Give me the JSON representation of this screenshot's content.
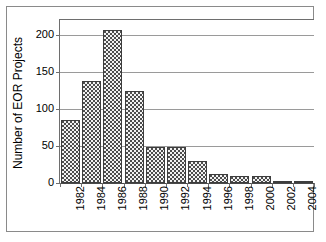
{
  "chart_data": {
    "type": "bar",
    "title": "",
    "subtitle": "",
    "xlabel": "",
    "ylabel": "Number of EOR Projects",
    "categories": [
      "1982",
      "1984",
      "1986",
      "1988",
      "1990",
      "1992",
      "1994",
      "1996",
      "1998",
      "2000",
      "2002",
      "2004"
    ],
    "values": [
      85,
      138,
      206,
      124,
      49,
      49,
      30,
      12,
      10,
      10,
      3,
      3
    ],
    "series": [
      {
        "name": "Number of EOR Projects",
        "values": [
          85,
          138,
          206,
          124,
          49,
          49,
          30,
          12,
          10,
          10,
          3,
          3
        ]
      }
    ],
    "ylim": [
      0,
      220
    ],
    "yticks": [
      0,
      50,
      100,
      150,
      200
    ],
    "ytick_labels": [
      "0",
      "50",
      "100",
      "150",
      "200"
    ],
    "xtick_labels": [
      "1982",
      "1984",
      "1986",
      "1988",
      "1990",
      "1992",
      "1994",
      "1996",
      "1998",
      "2000",
      "2002",
      "2004"
    ],
    "grid": true,
    "grid_axis": "y",
    "legend": false,
    "legend_position": "none",
    "bar_fill": "#4d4d4d",
    "bar_pattern": "checkerboard",
    "bar_edge_color": "#3d3d3d",
    "gridline_color": "#9a9a9a",
    "axis_color": "#6e6e6e",
    "background": "#ffffff",
    "x_label_rotation": -90,
    "y_label_rotation": -90
  },
  "figure": {
    "frame_visible": true,
    "frame_color": "#8a8a8a"
  }
}
